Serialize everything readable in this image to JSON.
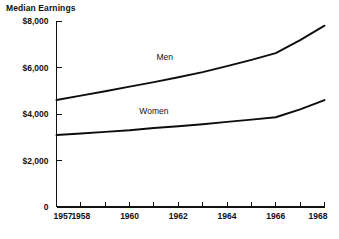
{
  "chart_data": {
    "type": "line",
    "title": "Median Earnings",
    "xlabel": "",
    "ylabel": "",
    "x": [
      1957,
      1958,
      1959,
      1960,
      1961,
      1962,
      1963,
      1964,
      1965,
      1966,
      1967,
      1968
    ],
    "xlim": [
      1957,
      1968
    ],
    "ylim": [
      0,
      8000
    ],
    "grid": false,
    "legend_position": "inline-labels",
    "y_tick_labels": [
      "$8,000",
      "$6,000",
      "$4,000",
      "$2,000",
      "0"
    ],
    "y_tick_values": [
      8000,
      6000,
      4000,
      2000,
      0
    ],
    "x_tick_labels": [
      "1957",
      "1958",
      "1960",
      "1962",
      "1964",
      "1966",
      "1968"
    ],
    "x_tick_values": [
      1957,
      1958,
      1960,
      1962,
      1964,
      1966,
      1968
    ],
    "x_minor_ticks": [
      1957,
      1958,
      1959,
      1960,
      1961,
      1962,
      1963,
      1964,
      1965,
      1966,
      1967,
      1968
    ],
    "series": [
      {
        "name": "Men",
        "label": "Men",
        "color": "#0d0d0d",
        "values": [
          4600,
          4790,
          4980,
          5180,
          5370,
          5580,
          5800,
          6060,
          6330,
          6620,
          7180,
          7800
        ]
      },
      {
        "name": "Women",
        "label": "Women",
        "color": "#0d0d0d",
        "values": [
          3100,
          3160,
          3230,
          3300,
          3400,
          3470,
          3560,
          3660,
          3760,
          3860,
          4200,
          4600
        ]
      }
    ],
    "annotations": [
      {
        "text": "Men",
        "x": 1961.1,
        "y": 6320
      },
      {
        "text": "Women",
        "x": 1960.4,
        "y": 4000
      }
    ]
  }
}
